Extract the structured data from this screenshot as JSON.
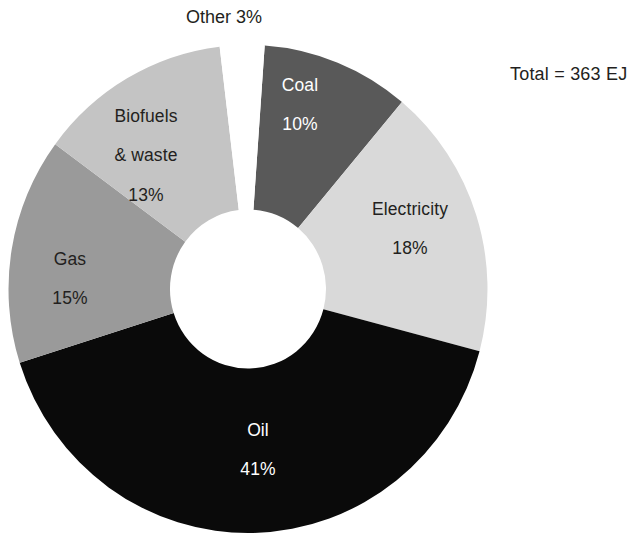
{
  "chart_data": {
    "type": "pie",
    "variant": "donut",
    "title": "",
    "subtitle": "",
    "xlabel": "",
    "ylabel": "",
    "legend": "none",
    "grid": false,
    "annotation": "Total = 363 EJ",
    "total_label": "Total",
    "total_value": "363",
    "total_unit": "EJ",
    "units": "EJ",
    "total": 363,
    "categories": [
      "Coal",
      "Electricity",
      "Oil",
      "Gas",
      "Biofuels & waste",
      "Other"
    ],
    "values": [
      10,
      18,
      41,
      15,
      13,
      3
    ],
    "slices": [
      {
        "name": "Coal",
        "label": "Coal",
        "value": 10,
        "value_label": "10%",
        "color": "#595959",
        "text_color": "#ffffff",
        "label_placement": "inside",
        "start_angle": 4,
        "end_angle": 40
      },
      {
        "name": "Electricity",
        "label": "Electricity",
        "value": 18,
        "value_label": "18%",
        "color": "#d9d9d9",
        "text_color": "#231f20",
        "label_placement": "inside",
        "start_angle": 40,
        "end_angle": 104.8
      },
      {
        "name": "Oil",
        "label": "Oil",
        "value": 41,
        "value_label": "41%",
        "color": "#0a0a0a",
        "text_color": "#ffffff",
        "label_placement": "inside",
        "start_angle": 104.8,
        "end_angle": 252.4
      },
      {
        "name": "Gas",
        "label": "Gas",
        "value": 15,
        "value_label": "15%",
        "color": "#9a9a9a",
        "text_color": "#231f20",
        "label_placement": "inside",
        "start_angle": 252.4,
        "end_angle": 306.4
      },
      {
        "name": "Biofuels & waste",
        "label": "Biofuels\n& waste",
        "label_line1": "Biofuels",
        "label_line2": "& waste",
        "value": 13,
        "value_label": "13%",
        "color": "#c4c4c4",
        "text_color": "#231f20",
        "label_placement": "inside",
        "start_angle": 306.4,
        "end_angle": 353.2
      },
      {
        "name": "Other",
        "label": "Other",
        "value": 3,
        "value_label": "3%",
        "color": "#ffffff",
        "text_color": "#231f20",
        "label_placement": "outside-top",
        "start_angle": 353.2,
        "end_angle": 364
      }
    ]
  },
  "colors": {
    "background": "#ffffff",
    "text": "#231f20",
    "coal": "#595959",
    "electricity": "#d9d9d9",
    "oil": "#0a0a0a",
    "gas": "#9a9a9a",
    "biofuels": "#c4c4c4",
    "other": "#ffffff"
  }
}
